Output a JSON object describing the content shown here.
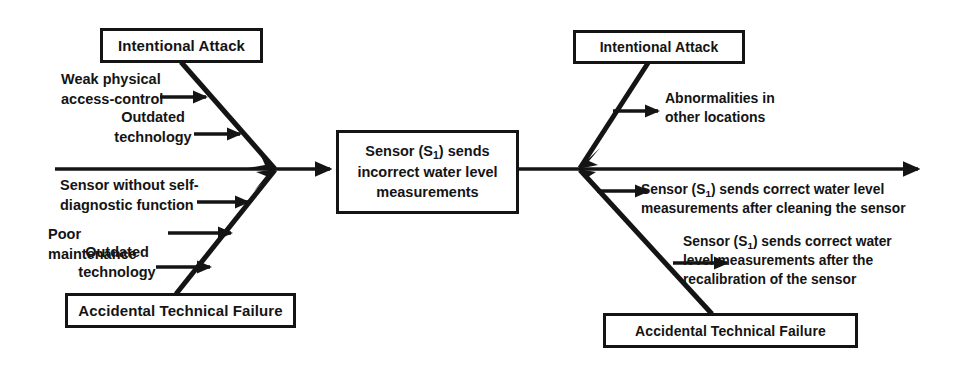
{
  "diagram": {
    "type": "fishbone-ishikawa",
    "colors": {
      "background": "#ffffff",
      "stroke": "#141414",
      "text": "#141414"
    },
    "spine": {
      "start_x": 55,
      "end_x": 920,
      "y": 169,
      "arrow": "right"
    },
    "effect": {
      "label": "Sensor (S₁) sends incorrect water level measurements",
      "lines": [
        "Sensor (S₁) sends",
        "incorrect water level",
        "measurements"
      ]
    },
    "categories": [
      {
        "id": "left-top",
        "label": "Intentional Attack",
        "side": "left",
        "position": "top"
      },
      {
        "id": "left-bottom",
        "label": "Accidental Technical Failure",
        "side": "left",
        "position": "bottom"
      },
      {
        "id": "right-top",
        "label": "Intentional Attack",
        "side": "right",
        "position": "top"
      },
      {
        "id": "right-bottom",
        "label": "Accidental Technical Failure",
        "side": "right",
        "position": "bottom"
      }
    ],
    "causes": [
      {
        "id": "weak-physical-access-control",
        "category": "left-top",
        "text": "Weak physical\naccess-control",
        "arrow": "right"
      },
      {
        "id": "outdated-technology-top",
        "category": "left-top",
        "text": "Outdated\ntechnology",
        "arrow": "right"
      },
      {
        "id": "sensor-without-self-diagnostic-function",
        "category": "left-bottom",
        "text": "Sensor without self-\ndiagnostic function",
        "arrow": "right"
      },
      {
        "id": "poor-maintenance",
        "category": "left-bottom",
        "text": "Poor maintenance",
        "arrow": "right"
      },
      {
        "id": "outdated-technology-bottom",
        "category": "left-bottom",
        "text": "Outdated\ntechnology",
        "arrow": "right"
      }
    ],
    "effects": [
      {
        "id": "abnormalities-in-other-locations",
        "category": "right-top",
        "text": "Abnormalities in\nother locations",
        "arrow": "right"
      },
      {
        "id": "correct-after-cleaning",
        "category": "right-bottom",
        "text": "Sensor (S₁)  sends correct water level\nmeasurements after cleaning the sensor",
        "arrow": "right"
      },
      {
        "id": "correct-after-recalibration",
        "category": "right-bottom",
        "text": "Sensor (S₁) sends correct water\nlevel measurements after the\nrecalibration of the sensor",
        "arrow": "right"
      }
    ]
  }
}
